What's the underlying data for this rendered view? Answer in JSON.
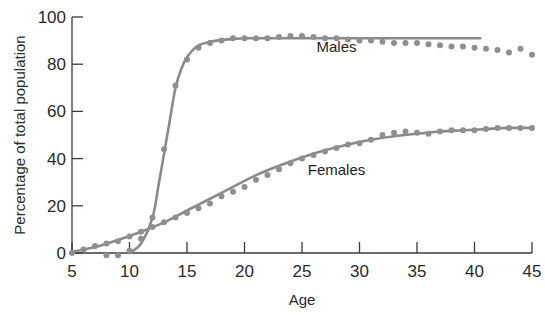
{
  "chart_data": {
    "type": "line",
    "title": "",
    "xlabel": "Age",
    "ylabel": "Percentage of total population",
    "xlim": [
      5,
      45
    ],
    "ylim": [
      0,
      100
    ],
    "grid": false,
    "legend": "inline labels",
    "x_ticks": [
      5,
      10,
      15,
      20,
      25,
      30,
      35,
      40,
      45
    ],
    "y_ticks": [
      0,
      20,
      40,
      60,
      80,
      100
    ],
    "series": [
      {
        "name": "Males",
        "label_position": {
          "x": 28,
          "y": 85
        },
        "fitted_curve": {
          "x": [
            10,
            11,
            12,
            12.5,
            13,
            13.5,
            14,
            14.5,
            15,
            15.5,
            16,
            17,
            18,
            19,
            20,
            22,
            25,
            30,
            35,
            40.5
          ],
          "y": [
            0,
            4,
            15,
            28,
            42,
            56,
            70,
            78,
            83,
            86,
            88,
            89.5,
            90.3,
            90.7,
            91,
            91,
            91,
            91,
            91,
            91
          ]
        },
        "observed": {
          "x": [
            8,
            9,
            10,
            11,
            12,
            13,
            14,
            15,
            16,
            17,
            18,
            19,
            20,
            21,
            22,
            23,
            24,
            25,
            26,
            27,
            28,
            29,
            30,
            31,
            32,
            33,
            34,
            35,
            36,
            37,
            38,
            39,
            40,
            41,
            42,
            43,
            44,
            45
          ],
          "y": [
            -1,
            -1,
            1,
            6,
            15,
            44,
            71,
            82,
            87,
            89,
            90,
            91,
            91,
            91,
            91,
            91.5,
            92,
            92,
            91.5,
            91,
            91,
            90.5,
            90,
            90,
            89.5,
            89,
            89,
            89,
            88.5,
            88,
            87.5,
            87.5,
            87,
            86.5,
            86,
            85,
            86.5,
            84
          ]
        }
      },
      {
        "name": "Females",
        "label_position": {
          "x": 28,
          "y": 33
        },
        "fitted_curve": {
          "x": [
            5,
            7,
            9,
            11,
            13,
            15,
            17,
            19,
            21,
            23,
            25,
            27,
            29,
            31,
            33,
            35,
            37,
            39,
            41,
            43,
            45
          ],
          "y": [
            0.5,
            2.5,
            5.5,
            9,
            13,
            18,
            23,
            28,
            33,
            37,
            40.5,
            43.5,
            46,
            48,
            49.5,
            50.5,
            51.5,
            52,
            52.5,
            53,
            53
          ]
        },
        "observed": {
          "x": [
            5,
            6,
            7,
            8,
            9,
            10,
            11,
            12,
            13,
            14,
            15,
            16,
            17,
            18,
            19,
            20,
            21,
            22,
            23,
            24,
            25,
            26,
            27,
            28,
            29,
            30,
            31,
            32,
            33,
            34,
            35,
            36,
            37,
            38,
            39,
            40,
            41,
            42,
            43,
            44,
            45
          ],
          "y": [
            0,
            1.5,
            3,
            4,
            5,
            7,
            9,
            11,
            13,
            15,
            17,
            19,
            21,
            24,
            26,
            28,
            31,
            33,
            35.5,
            38,
            40,
            41.5,
            43,
            44.5,
            46,
            46.5,
            48,
            50,
            51,
            51.5,
            51,
            50.5,
            51.5,
            52,
            52,
            52,
            52.5,
            53,
            53,
            53,
            53
          ]
        }
      }
    ],
    "style": {
      "line_color": "#8a8a8a",
      "dot_color": "#8f8f8f",
      "axis_color": "#3a3a3a"
    }
  }
}
